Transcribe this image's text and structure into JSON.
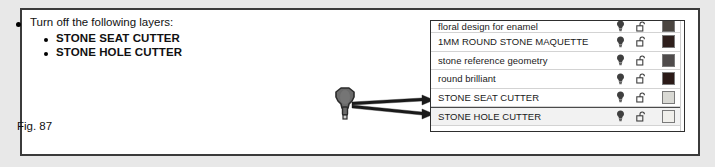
{
  "figure": {
    "caption": "Fig. 87",
    "instructions": {
      "heading": "Turn off the following layers:",
      "items": [
        "STONE SEAT CUTTER",
        "STONE HOLE CUTTER"
      ]
    },
    "tool_glyph": {
      "name": "stone-cutter-bur-tool",
      "fill_color": "#6b6b6b",
      "stroke_color": "#2b2b2b"
    },
    "arrows": {
      "count": 2,
      "color": "#1a1a1a",
      "targets": [
        "STONE SEAT CUTTER",
        "STONE HOLE CUTTER"
      ]
    },
    "frame_color": "#3b3b3b",
    "page_background": "#e8e8e8"
  },
  "layer_panel": {
    "icons": {
      "visibility": "lightbulb-icon",
      "lock": "open-padlock-icon",
      "swatch": "color-swatch"
    },
    "rows": [
      {
        "name": "floral design for enamel",
        "clipped": true,
        "selected": false,
        "visible": true,
        "locked": false,
        "swatch_color": "#4a4540"
      },
      {
        "name": "1MM ROUND STONE MAQUETTE",
        "clipped": false,
        "selected": false,
        "visible": true,
        "locked": false,
        "swatch_color": "#2e1f1c"
      },
      {
        "name": "stone reference geometry",
        "clipped": false,
        "selected": false,
        "visible": true,
        "locked": false,
        "swatch_color": "#4f4b4b"
      },
      {
        "name": "round brilliant",
        "clipped": false,
        "selected": false,
        "visible": true,
        "locked": false,
        "swatch_color": "#2b1a17"
      },
      {
        "name": "STONE SEAT CUTTER",
        "clipped": false,
        "selected": false,
        "visible": true,
        "locked": false,
        "swatch_color": "#d9d9d4"
      },
      {
        "name": "STONE HOLE CUTTER",
        "clipped": false,
        "selected": true,
        "visible": true,
        "locked": false,
        "swatch_color": "#f0efeb"
      }
    ]
  }
}
